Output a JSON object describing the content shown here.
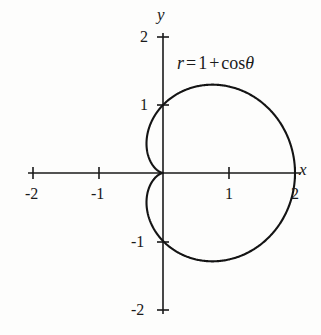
{
  "figure": {
    "background_color": "#fdfdfc",
    "ink_color": "#1a1a1a"
  },
  "axes": {
    "x_label": "x",
    "y_label": "y",
    "x_ticks": [
      "-2",
      "-1",
      "1",
      "2"
    ],
    "y_ticks": [
      "2",
      "1",
      "-1",
      "-2"
    ]
  },
  "annotation": {
    "equation_full": "r = 1 + cos θ",
    "lhs": "r",
    "equals": "=",
    "one": "1",
    "plus": "+",
    "cos": "cos",
    "theta": "θ"
  },
  "chart_data": {
    "type": "line",
    "title": "",
    "subtitle": "",
    "xlabel": "x",
    "ylabel": "y",
    "curve_name": "cardioid",
    "polar_equation": "r = 1 + cos θ",
    "coordinate_system": "polar plotted on cartesian axes",
    "xlim": [
      -2.1,
      2.1
    ],
    "ylim": [
      -2.1,
      2.1
    ],
    "xticks": [
      -2,
      -1,
      1,
      2
    ],
    "yticks": [
      -2,
      -1,
      1,
      2
    ],
    "grid": false,
    "legend": "none",
    "annotations": [
      {
        "text": "r = 1 + cos θ",
        "x": 0.25,
        "y": 1.75
      }
    ],
    "key_points": [
      {
        "label": "cusp (theta=180)",
        "x": 0.0,
        "y": 0.0
      },
      {
        "label": "theta=90",
        "x": 0.0,
        "y": 1.0
      },
      {
        "label": "theta=0 (max r=2)",
        "x": 2.0,
        "y": 0.0
      },
      {
        "label": "theta=270",
        "x": 0.0,
        "y": -1.0
      },
      {
        "label": "max y",
        "x": 0.75,
        "y": 1.299
      },
      {
        "label": "min y",
        "x": 0.75,
        "y": -1.299
      },
      {
        "label": "min x",
        "x": -0.25,
        "y": 0.433
      }
    ],
    "theta_degrees": [
      0,
      15,
      30,
      45,
      60,
      75,
      90,
      105,
      120,
      135,
      150,
      165,
      180,
      195,
      210,
      225,
      240,
      255,
      270,
      285,
      300,
      315,
      330,
      345,
      360
    ],
    "r_values": [
      2.0,
      1.966,
      1.866,
      1.707,
      1.5,
      1.259,
      1.0,
      0.741,
      0.5,
      0.293,
      0.134,
      0.034,
      0.0,
      0.034,
      0.134,
      0.293,
      0.5,
      0.741,
      1.0,
      1.259,
      1.5,
      1.707,
      1.866,
      1.966,
      2.0
    ],
    "x": [
      2.0,
      1.899,
      1.616,
      1.207,
      0.75,
      0.326,
      0.0,
      -0.192,
      -0.25,
      -0.207,
      -0.116,
      -0.033,
      0.0,
      -0.033,
      -0.116,
      -0.207,
      -0.25,
      -0.192,
      0.0,
      0.326,
      0.75,
      1.207,
      1.616,
      1.899,
      2.0
    ],
    "y": [
      0.0,
      0.509,
      0.933,
      1.207,
      1.299,
      1.216,
      1.0,
      0.716,
      0.433,
      0.207,
      0.067,
      0.009,
      0.0,
      -0.009,
      -0.067,
      -0.207,
      -0.433,
      -0.716,
      -1.0,
      -1.216,
      -1.299,
      -1.207,
      -0.933,
      -0.509,
      0.0
    ]
  }
}
